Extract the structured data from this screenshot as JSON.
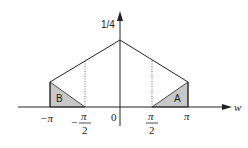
{
  "diagram": {
    "y_axis_label": "1/4",
    "x_axis_label": "w",
    "origin_label": "0",
    "ticks": {
      "neg_pi": "−π",
      "neg_half_pi_sign": "−",
      "neg_half_pi_num": "π",
      "neg_half_pi_den": "2",
      "half_pi_num": "π",
      "half_pi_den": "2",
      "pi": "π"
    },
    "regions": {
      "left": "B",
      "right": "A"
    },
    "colors": {
      "line": "#222222",
      "fill": "#c8c8c8",
      "background": "#ffffff"
    }
  }
}
